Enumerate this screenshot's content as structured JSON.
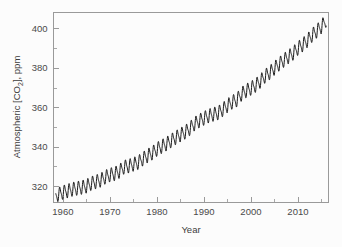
{
  "figure": {
    "background_color": "#fcfcfc",
    "frame_color": "#9a9a9a",
    "line_color": "#1a1a1a"
  },
  "chart_data": {
    "type": "line",
    "title": "",
    "xlabel": "Year",
    "ylabel": "Atmospheric [CO2], ppm",
    "ylabel_parts": {
      "prefix": "Atmospheric [CO",
      "subscript": "2",
      "suffix": "], ppm"
    },
    "xlim": [
      1958,
      2016.5
    ],
    "ylim": [
      312,
      408
    ],
    "xticks": [
      1960,
      1970,
      1980,
      1990,
      2000,
      2010
    ],
    "xtick_labels": [
      "1960",
      "1970",
      "1980",
      "1990",
      "2000",
      "2010"
    ],
    "xminor_step": 5,
    "yticks": [
      320,
      340,
      360,
      380,
      400
    ],
    "ytick_labels": [
      "320",
      "340",
      "360",
      "380",
      "400"
    ],
    "yminor_step": 10,
    "grid": false,
    "legend": null,
    "series": [
      {
        "name": "Mauna Loa monthly mean CO2",
        "seasonal_amplitude_ppm": 3.1,
        "x": [
          1958.5,
          1959,
          1960,
          1961,
          1962,
          1963,
          1964,
          1965,
          1966,
          1967,
          1968,
          1969,
          1970,
          1971,
          1972,
          1973,
          1974,
          1975,
          1976,
          1977,
          1978,
          1979,
          1980,
          1981,
          1982,
          1983,
          1984,
          1985,
          1986,
          1987,
          1988,
          1989,
          1990,
          1991,
          1992,
          1993,
          1994,
          1995,
          1996,
          1997,
          1998,
          1999,
          2000,
          2001,
          2002,
          2003,
          2004,
          2005,
          2006,
          2007,
          2008,
          2009,
          2010,
          2011,
          2012,
          2013,
          2014,
          2015,
          2016
        ],
        "values": [
          315.0,
          315.8,
          316.9,
          317.6,
          318.4,
          318.9,
          319.4,
          320.0,
          321.4,
          322.2,
          323.0,
          324.6,
          325.7,
          326.3,
          327.5,
          329.7,
          330.2,
          331.1,
          332.0,
          333.8,
          335.4,
          336.8,
          338.7,
          340.1,
          341.4,
          343.0,
          344.6,
          346.0,
          347.4,
          349.2,
          351.6,
          353.1,
          354.4,
          355.6,
          356.4,
          357.1,
          358.8,
          360.8,
          362.6,
          363.7,
          366.7,
          368.4,
          369.6,
          371.1,
          373.2,
          375.8,
          377.5,
          379.8,
          381.9,
          383.8,
          385.6,
          387.4,
          389.9,
          391.6,
          393.8,
          396.5,
          398.6,
          400.8,
          404.2
        ]
      }
    ]
  }
}
